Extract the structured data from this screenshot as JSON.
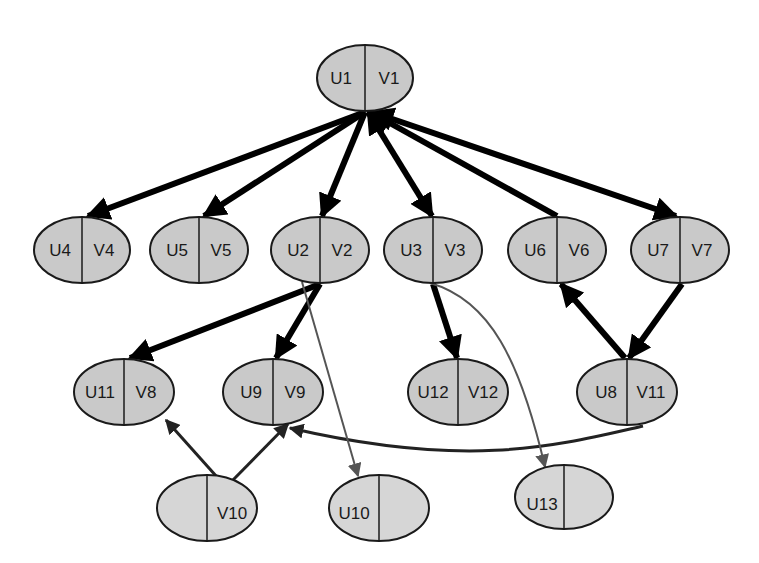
{
  "diagram": {
    "title": "",
    "nodes": [
      {
        "id": "n1",
        "left": "U1",
        "right": "V1",
        "cx": 365,
        "cy": 78,
        "shade": "dark"
      },
      {
        "id": "n4",
        "left": "U4",
        "right": "V4",
        "cx": 82,
        "cy": 250,
        "shade": "dark"
      },
      {
        "id": "n5",
        "left": "U5",
        "right": "V5",
        "cx": 199,
        "cy": 250,
        "shade": "dark"
      },
      {
        "id": "n2",
        "left": "U2",
        "right": "V2",
        "cx": 320,
        "cy": 250,
        "shade": "dark"
      },
      {
        "id": "n3",
        "left": "U3",
        "right": "V3",
        "cx": 433,
        "cy": 250,
        "shade": "dark"
      },
      {
        "id": "n6",
        "left": "U6",
        "right": "V6",
        "cx": 557,
        "cy": 250,
        "shade": "dark"
      },
      {
        "id": "n7",
        "left": "U7",
        "right": "V7",
        "cx": 680,
        "cy": 250,
        "shade": "dark"
      },
      {
        "id": "n11",
        "left": "U11",
        "right": "V8",
        "cx": 124,
        "cy": 392,
        "shade": "dark"
      },
      {
        "id": "n9",
        "left": "U9",
        "right": "V9",
        "cx": 273,
        "cy": 392,
        "shade": "dark"
      },
      {
        "id": "n12",
        "left": "U12",
        "right": "V12",
        "cx": 458,
        "cy": 392,
        "shade": "dark"
      },
      {
        "id": "n8",
        "left": "U8",
        "right": "V11",
        "cx": 627,
        "cy": 392,
        "shade": "dark"
      },
      {
        "id": "n10v",
        "left": "",
        "right": "V10",
        "cx": 207,
        "cy": 508,
        "shade": "light"
      },
      {
        "id": "n10u",
        "left": "U10",
        "right": "",
        "cx": 379,
        "cy": 508,
        "shade": "light"
      },
      {
        "id": "n13",
        "left": "U13",
        "right": "",
        "cx": 564,
        "cy": 497,
        "shade": "light"
      }
    ],
    "edges": [
      {
        "from": "U1",
        "to": "U4",
        "weight": "thick",
        "direction": "forward"
      },
      {
        "from": "U1",
        "to": "U5",
        "weight": "thick",
        "direction": "forward"
      },
      {
        "from": "U1",
        "to": "U2",
        "weight": "thick",
        "direction": "forward"
      },
      {
        "from": "U1",
        "to": "U3",
        "weight": "thick",
        "direction": "both"
      },
      {
        "from": "U6",
        "to": "U1",
        "weight": "thick",
        "direction": "forward"
      },
      {
        "from": "U1",
        "to": "U7",
        "weight": "thick",
        "direction": "both"
      },
      {
        "from": "U2",
        "to": "U11",
        "weight": "thick",
        "direction": "forward"
      },
      {
        "from": "U2",
        "to": "U9",
        "weight": "thick",
        "direction": "forward"
      },
      {
        "from": "U3",
        "to": "U12",
        "weight": "thick",
        "direction": "forward"
      },
      {
        "from": "U7",
        "to": "U8",
        "weight": "thick",
        "direction": "forward"
      },
      {
        "from": "U8",
        "to": "U6",
        "weight": "thick",
        "direction": "forward"
      },
      {
        "from": "V10",
        "to": "V8",
        "weight": "medium",
        "direction": "forward"
      },
      {
        "from": "V10",
        "to": "U9",
        "weight": "medium",
        "direction": "forward"
      },
      {
        "from": "V11",
        "to": "V9",
        "weight": "medium",
        "direction": "forward"
      },
      {
        "from": "U2",
        "to": "U10",
        "weight": "thin",
        "direction": "forward"
      },
      {
        "from": "U3",
        "to": "U13",
        "weight": "thin",
        "direction": "forward"
      }
    ],
    "colors": {
      "node_fill": "#c9c9c9",
      "node_fill_light": "#d6d6d6",
      "outline": "#1a1a1a",
      "edge_thick": "#000000",
      "edge_thin": "#555555",
      "background": "#ffffff"
    }
  }
}
